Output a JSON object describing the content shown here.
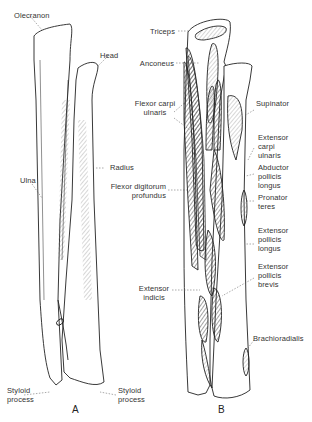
{
  "figure": {
    "panel_a": {
      "caption": "A",
      "labels": {
        "olecranon": "Olecranon",
        "head": "Head",
        "ulna": "Ulna",
        "radius": "Radius",
        "styloid_left_1": "Styloid",
        "styloid_left_2": "process",
        "styloid_right_1": "Styloid",
        "styloid_right_2": "process"
      }
    },
    "panel_b": {
      "caption": "B",
      "labels": {
        "triceps": "Triceps",
        "anconeus": "Anconeus",
        "flexor_carpi_ulnaris_1": "Flexor carpi",
        "flexor_carpi_ulnaris_2": "ulnaris",
        "flexor_digitorum_1": "Flexor digitorum",
        "flexor_digitorum_2": "profundus",
        "extensor_indicis_1": "Extensor",
        "extensor_indicis_2": "indicis",
        "supinator": "Supinator",
        "ecu_1": "Extensor",
        "ecu_2": "carpi",
        "ecu_3": "ulnaris",
        "apl_1": "Abductor",
        "apl_2": "pollicis",
        "apl_3": "longus",
        "pt_1": "Pronator",
        "pt_2": "teres",
        "epl_1": "Extensor",
        "epl_2": "pollicis",
        "epl_3": "longus",
        "epb_1": "Extensor",
        "epb_2": "pollicis",
        "epb_3": "brevis",
        "brachioradialis": "Brachioradialis"
      }
    }
  }
}
